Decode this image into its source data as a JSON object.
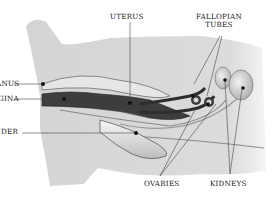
{
  "diagram": {
    "type": "anatomical-illustration",
    "labels": {
      "anus": "ANUS",
      "vagina": "VAGINA",
      "bladder": "BLADDER",
      "uterus": "UTERUS",
      "fallopian_tubes_line1": "FALLOPIAN",
      "fallopian_tubes_line2": "TUBES",
      "ovaries": "OVARIES",
      "kidneys": "KIDNEYS"
    },
    "visible_label_text": {
      "anus": "ANUS",
      "vagina": "GINA",
      "bladder": "DER"
    },
    "colors": {
      "body_fill": "#d9d9d9",
      "organ_dark": "#3a3a3a",
      "organ_light": "#eeeeee",
      "outline": "#7a7a7a",
      "leader_line": "#444444",
      "dot": "#111111",
      "background": "#ffffff"
    }
  }
}
